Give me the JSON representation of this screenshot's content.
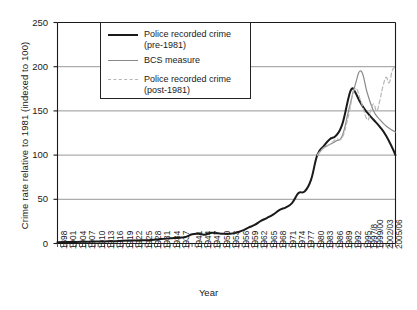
{
  "chart_data": {
    "type": "line",
    "title": "",
    "xlabel": "Year",
    "ylabel": "Crime rate relative to 1981 (indexed to 100)",
    "ylim": [
      0,
      250
    ],
    "yticks": [
      0,
      50,
      100,
      150,
      200,
      250
    ],
    "grid": true,
    "legend_position": "top-center",
    "x_start_year": 1898,
    "x_end_year": 2006,
    "xticks": [
      "1898",
      "1901",
      "1904",
      "1907",
      "1910",
      "1913",
      "1916",
      "1919",
      "1922",
      "1925",
      "1928",
      "1931",
      "1934",
      "1937",
      "1941",
      "1944",
      "1947",
      "1950",
      "1953",
      "1956",
      "1959",
      "1962",
      "1965",
      "1968",
      "1971",
      "1974",
      "1977",
      "1980",
      "1983",
      "1986",
      "1989",
      "1992",
      "1995",
      "1997/8",
      "1999/00",
      "2002/03",
      "2005/06"
    ],
    "series": [
      {
        "name": "Police recorded crime (pre-1981)",
        "style": "solid",
        "color": "#1a1a1a",
        "width": 2.0,
        "x": [
          1898,
          1901,
          1904,
          1907,
          1910,
          1913,
          1916,
          1919,
          1922,
          1925,
          1928,
          1931,
          1934,
          1937,
          1939,
          1941,
          1943,
          1945,
          1947,
          1949,
          1951,
          1953,
          1955,
          1957,
          1959,
          1961,
          1963,
          1965,
          1967,
          1969,
          1971,
          1973,
          1975,
          1977,
          1979,
          1981,
          1983,
          1985,
          1987,
          1989,
          1991,
          1992,
          1993,
          1995,
          1997,
          1999,
          2001,
          2003,
          2005,
          2006
        ],
        "y": [
          1.5,
          1.6,
          1.8,
          2.0,
          2.2,
          2.4,
          2.6,
          3.2,
          3.4,
          3.6,
          4.0,
          5.0,
          5.8,
          6.6,
          7.5,
          10.5,
          11.0,
          10.0,
          12.0,
          11.5,
          11.0,
          11.0,
          12.0,
          14.5,
          18.0,
          21.0,
          25.5,
          29.0,
          33.0,
          38.0,
          41.0,
          46.0,
          57.0,
          59.0,
          72.0,
          100.0,
          110.0,
          118.0,
          122.0,
          135.0,
          165.0,
          175.0,
          172.0,
          158.0,
          148.0,
          140.0,
          132.0,
          122.0,
          108.0,
          100.0
        ]
      },
      {
        "name": "BCS measure",
        "style": "solid",
        "color": "#8a8a8a",
        "width": 1.2,
        "x": [
          1981,
          1983,
          1985,
          1987,
          1989,
          1991,
          1993,
          1995,
          1997,
          1999,
          2001,
          2003,
          2005,
          2006
        ],
        "y": [
          100,
          108,
          112,
          116,
          122,
          150,
          178,
          195,
          170,
          150,
          140,
          133,
          128,
          126
        ]
      },
      {
        "name": "Police recorded crime (post-1981)",
        "style": "dashed",
        "color": "#b6b6b6",
        "width": 1.2,
        "x": [
          1981,
          1983,
          1985,
          1987,
          1989,
          1991,
          1993,
          1995,
          1997,
          1998,
          1999,
          2000,
          2001,
          2002,
          2003,
          2004,
          2005,
          2006
        ],
        "y": [
          100,
          108,
          112,
          118,
          120,
          145,
          175,
          160,
          140,
          150,
          158,
          150,
          162,
          178,
          188,
          182,
          196,
          200
        ]
      }
    ]
  },
  "legend": {
    "entries": [
      {
        "label": "Police recorded crime\n(pre-1981)"
      },
      {
        "label": "BCS measure"
      },
      {
        "label": "Police recorded crime\n(post-1981)"
      }
    ]
  }
}
